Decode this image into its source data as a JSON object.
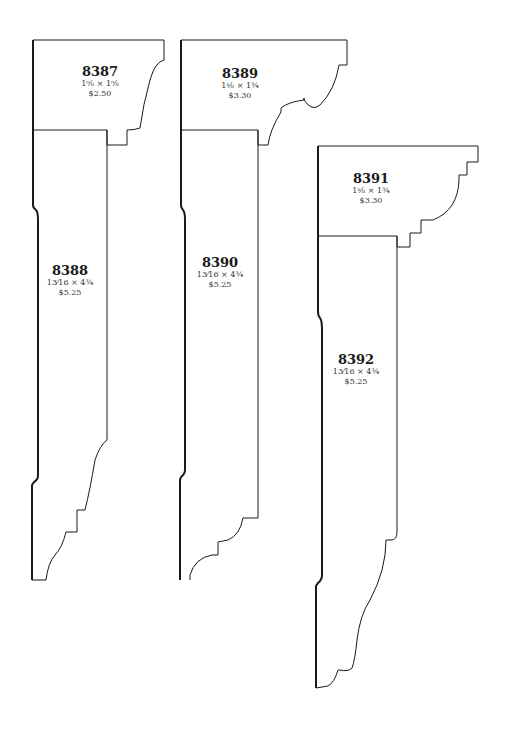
{
  "mouldings": [
    {
      "number": "8387",
      "size": "1⅝ × 1⅝",
      "price": "$2.50"
    },
    {
      "number": "8388",
      "size": "13⁄16 × 4¾",
      "price": "$5.25"
    },
    {
      "number": "8389",
      "size": "1⅛ × 1¾",
      "price": "$3.30"
    },
    {
      "number": "8390",
      "size": "13⁄16 × 4¾",
      "price": "$5.25"
    },
    {
      "number": "8391",
      "size": "1⅛ × 1¾",
      "price": "$3.30"
    },
    {
      "number": "8392",
      "size": "13⁄16 × 4¾",
      "price": "$5.25"
    }
  ],
  "colors": {
    "line": "#1a1a1a",
    "background": "#ffffff"
  }
}
